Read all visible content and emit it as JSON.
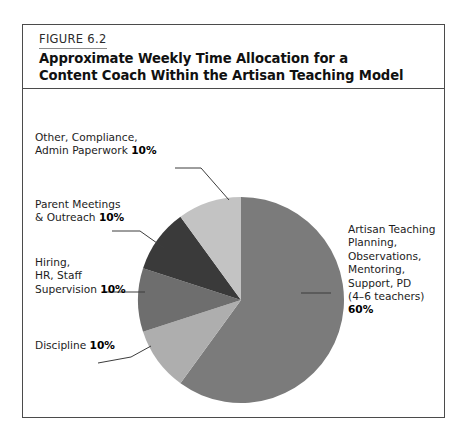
{
  "figure": {
    "number": "FIGURE 6.2",
    "title_line1": "Approximate Weekly Time Allocation for a",
    "title_line2": "Content Coach Within the Artisan Teaching Model"
  },
  "labels": {
    "other": {
      "line1": "Other, Compliance,",
      "line2": "Admin Paperwork ",
      "percent": "10%"
    },
    "parent": {
      "line1": "Parent Meetings",
      "line2": "& Outreach ",
      "percent": "10%"
    },
    "hiring": {
      "line1": "Hiring,",
      "line2": "HR, Staff",
      "line3": "Supervision ",
      "percent": "10%"
    },
    "discipline": {
      "line1": "Discipline ",
      "percent": "10%"
    },
    "artisan": {
      "line1": "Artisan Teaching",
      "line2": "Planning,",
      "line3": "Observations,",
      "line4": "Mentoring,",
      "line5": "Support, PD",
      "line6": "(4–6 teachers)",
      "percent": "60%"
    }
  },
  "chart_data": {
    "type": "pie",
    "title": "Approximate Weekly Time Allocation for a Content Coach Within the Artisan Teaching Model",
    "legend_position": "callout-labels",
    "grid": false,
    "units": "percent",
    "total": 100,
    "start_angle_deg": 0,
    "direction": "clockwise",
    "categories": [
      "Artisan Teaching Planning, Observations, Mentoring, Support, PD (4–6 teachers)",
      "Discipline",
      "Hiring, HR, Staff Supervision",
      "Parent Meetings & Outreach",
      "Other, Compliance, Admin Paperwork"
    ],
    "values": [
      60,
      10,
      10,
      10,
      10
    ],
    "colors": [
      "#7b7b7b",
      "#aeaeae",
      "#6e6e6e",
      "#3a3a3a",
      "#c3c3c3"
    ],
    "slices": [
      {
        "label": "Artisan Teaching Planning, Observations, Mentoring, Support, PD (4–6 teachers)",
        "value": 60,
        "color": "#7b7b7b"
      },
      {
        "label": "Discipline",
        "value": 10,
        "color": "#aeaeae"
      },
      {
        "label": "Hiring, HR, Staff Supervision",
        "value": 10,
        "color": "#6e6e6e"
      },
      {
        "label": "Parent Meetings & Outreach",
        "value": 10,
        "color": "#3a3a3a"
      },
      {
        "label": "Other, Compliance, Admin Paperwork",
        "value": 10,
        "color": "#c3c3c3"
      }
    ]
  },
  "style": {
    "border_color": "#4b4b4b",
    "leader_color": "#3c3c3c",
    "background": "#ffffff"
  }
}
